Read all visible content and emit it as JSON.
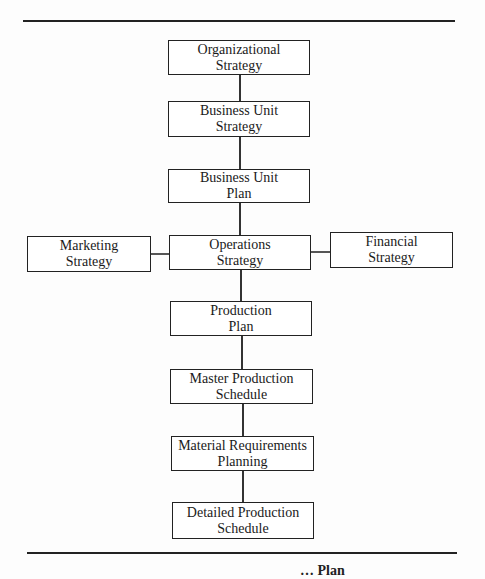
{
  "diagram": {
    "type": "hierarchy-flowchart",
    "nodes": [
      {
        "id": "org",
        "line1": "Organizational",
        "line2": "Strategy"
      },
      {
        "id": "bus",
        "line1": "Business Unit",
        "line2": "Strategy"
      },
      {
        "id": "bup",
        "line1": "Business Unit",
        "line2": "Plan"
      },
      {
        "id": "mkt",
        "line1": "Marketing",
        "line2": "Strategy"
      },
      {
        "id": "ops",
        "line1": "Operations",
        "line2": "Strategy"
      },
      {
        "id": "fin",
        "line1": "Financial",
        "line2": "Strategy"
      },
      {
        "id": "pp",
        "line1": "Production",
        "line2": "Plan"
      },
      {
        "id": "mps",
        "line1": "Master Production",
        "line2": "Schedule"
      },
      {
        "id": "mrp",
        "line1": "Material Requirements",
        "line2": "Planning"
      },
      {
        "id": "dps",
        "line1": "Detailed Production",
        "line2": "Schedule"
      }
    ],
    "edges": [
      [
        "org",
        "bus"
      ],
      [
        "bus",
        "bup"
      ],
      [
        "bup",
        "ops"
      ],
      [
        "mkt",
        "ops"
      ],
      [
        "ops",
        "fin"
      ],
      [
        "ops",
        "pp"
      ],
      [
        "pp",
        "mps"
      ],
      [
        "mps",
        "mrp"
      ],
      [
        "mrp",
        "dps"
      ]
    ],
    "caption_partial": "… Plan"
  }
}
